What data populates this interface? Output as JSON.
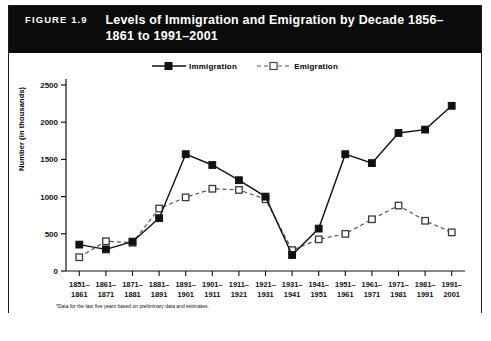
{
  "figure": {
    "label": "FIGURE 1.9",
    "title": "Levels of Immigration and Emigration by Decade 1856–1861 to 1991–2001",
    "footnote": "*Data for the last five years based on preliminary data and estimates.",
    "border_color": "#1b1b1b",
    "title_bar_color": "#0b0b0b",
    "title_text_color": "#ffffff"
  },
  "legend": {
    "position": "top-center",
    "entries": [
      {
        "label": "Immigration",
        "marker": "filled-square",
        "line": "solid",
        "color": "#111111"
      },
      {
        "label": "Emigration",
        "marker": "open-square",
        "line": "dashed",
        "color": "#555555"
      }
    ]
  },
  "chart_data": {
    "type": "line",
    "title": "Levels of Immigration and Emigration by Decade 1856–1861 to 1991–2001",
    "xlabel": "",
    "ylabel": "Number (in thousands)",
    "ylim": [
      0,
      2500
    ],
    "yticks": [
      0,
      500,
      1000,
      1500,
      2000,
      2500
    ],
    "grid": false,
    "categories": [
      "1851–1861",
      "1861–1871",
      "1871–1881",
      "1881–1891",
      "1891–1901",
      "1901–1911",
      "1911–1921",
      "1921–1931",
      "1931–1941",
      "1941–1951",
      "1951–1961",
      "1961–1971",
      "1971–1981",
      "1981–1991",
      "1991–2001"
    ],
    "series": [
      {
        "name": "Immigration",
        "values": [
          355,
          290,
          395,
          710,
          1570,
          1425,
          1220,
          1000,
          215,
          570,
          1570,
          1450,
          1855,
          1900,
          2220
        ]
      },
      {
        "name": "Emigration",
        "values": [
          185,
          400,
          380,
          840,
          990,
          1105,
          1090,
          965,
          280,
          425,
          500,
          695,
          880,
          675,
          520
        ]
      }
    ]
  }
}
